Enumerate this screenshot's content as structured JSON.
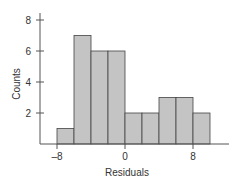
{
  "chart_data": {
    "type": "bar",
    "title": "",
    "xlabel": "Residuals",
    "ylabel": "Counts",
    "bin_edges": [
      -8,
      -6,
      -4,
      -2,
      0,
      2,
      4,
      6,
      8,
      10
    ],
    "categories": [
      "-8 to -6",
      "-6 to -4",
      "-4 to -2",
      "-2 to 0",
      "0 to 2",
      "2 to 4",
      "4 to 6",
      "6 to 8",
      "8 to 10"
    ],
    "values": [
      1,
      7,
      6,
      6,
      2,
      2,
      3,
      3,
      2
    ],
    "xticks": [
      -8,
      0,
      8
    ],
    "xtick_labels": [
      "–8",
      "0",
      "8"
    ],
    "yticks": [
      2,
      4,
      6,
      8
    ],
    "ytick_labels": [
      "2",
      "4",
      "6",
      "8"
    ],
    "ylim": [
      0,
      8
    ],
    "xlim": [
      -10,
      12
    ],
    "grid": false,
    "legend": null,
    "bar_color": "#c4c4c4",
    "bar_edge_color": "#444444"
  }
}
